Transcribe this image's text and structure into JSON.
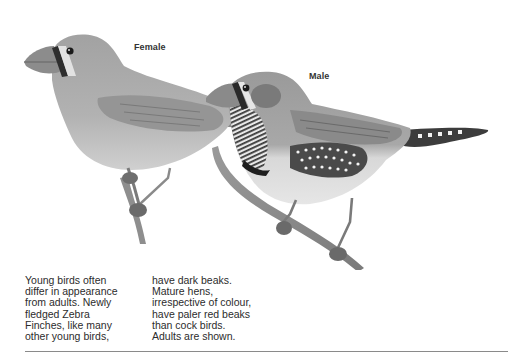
{
  "figure": {
    "subject": "Zebra Finches",
    "labels": {
      "female": "Female",
      "male": "Male"
    },
    "colors": {
      "background": "#ffffff",
      "female_body": "#a8a8a8",
      "female_belly": "#c8c8c8",
      "male_body": "#a4a4a4",
      "male_belly": "#dcdcdc",
      "cheek_patch": "#7e7e7e",
      "flank": "#4a4a4a",
      "beak": "#8c8c8c",
      "branch": "#8a8a8a",
      "divider": "#8a8a8a"
    }
  },
  "caption": {
    "column_1": "Young birds often\ndiffer in appearance\nfrom adults. Newly\nfledged Zebra\nFinches, like many\nother young birds,",
    "column_2": "have dark beaks.\nMature hens,\nirrespective of colour,\nhave paler red beaks\nthan cock birds.\nAdults are shown."
  }
}
